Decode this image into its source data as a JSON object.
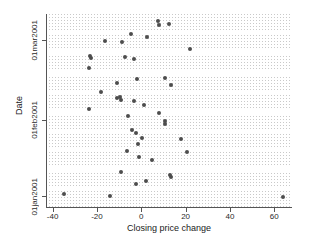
{
  "chart_data": {
    "type": "scatter",
    "title": "",
    "xlabel": "Closing price change",
    "ylabel": "Date",
    "xlim": [
      -43,
      68
    ],
    "ylim_labels": [
      "01jan2001",
      "01mar2001"
    ],
    "grid": "dotted-bands",
    "legend": "none",
    "marker_color": "#4d4d4d",
    "axis_color": "#555555",
    "x_ticks": [
      {
        "value": -40,
        "label": "-40"
      },
      {
        "value": -20,
        "label": "-20"
      },
      {
        "value": 0,
        "label": "0"
      },
      {
        "value": 20,
        "label": "20"
      },
      {
        "value": 40,
        "label": "40"
      },
      {
        "value": 60,
        "label": "60"
      }
    ],
    "y_ticks": [
      {
        "label": "01jan2001",
        "py": 196
      },
      {
        "label": "01feb2001",
        "py": 120
      },
      {
        "label": "01mar2001",
        "py": 40
      }
    ],
    "points": [
      {
        "x": 7.5,
        "py": 21
      },
      {
        "x": 8.0,
        "py": 25
      },
      {
        "x": 12.5,
        "py": 24
      },
      {
        "x": -4.5,
        "py": 34
      },
      {
        "x": 2.5,
        "py": 37
      },
      {
        "x": -16.5,
        "py": 41
      },
      {
        "x": -8.5,
        "py": 42
      },
      {
        "x": 22.0,
        "py": 49
      },
      {
        "x": -7.5,
        "py": 57
      },
      {
        "x": -3.5,
        "py": 59
      },
      {
        "x": -23.0,
        "py": 56
      },
      {
        "x": -22.5,
        "py": 58
      },
      {
        "x": -23.5,
        "py": 68
      },
      {
        "x": -2.0,
        "py": 79
      },
      {
        "x": 10.5,
        "py": 78
      },
      {
        "x": -11.0,
        "py": 83
      },
      {
        "x": 13.5,
        "py": 85
      },
      {
        "x": -18.0,
        "py": 92
      },
      {
        "x": -11.0,
        "py": 98
      },
      {
        "x": -9.5,
        "py": 97
      },
      {
        "x": -9.0,
        "py": 100
      },
      {
        "x": -3.5,
        "py": 101
      },
      {
        "x": -23.5,
        "py": 109
      },
      {
        "x": 1.0,
        "py": 105
      },
      {
        "x": 8.0,
        "py": 113
      },
      {
        "x": -6.0,
        "py": 116
      },
      {
        "x": 10.5,
        "py": 121
      },
      {
        "x": 10.5,
        "py": 124
      },
      {
        "x": -4.0,
        "py": 130
      },
      {
        "x": -2.5,
        "py": 133
      },
      {
        "x": 0.5,
        "py": 138
      },
      {
        "x": 18.0,
        "py": 139
      },
      {
        "x": -1.5,
        "py": 144
      },
      {
        "x": -6.5,
        "py": 151
      },
      {
        "x": 20.5,
        "py": 152
      },
      {
        "x": -1.0,
        "py": 157
      },
      {
        "x": 5.0,
        "py": 160
      },
      {
        "x": -9.0,
        "py": 172
      },
      {
        "x": 13.0,
        "py": 175
      },
      {
        "x": 13.5,
        "py": 177
      },
      {
        "x": -2.5,
        "py": 184
      },
      {
        "x": 2.0,
        "py": 181
      },
      {
        "x": -35.0,
        "py": 194
      },
      {
        "x": -14.0,
        "py": 196
      },
      {
        "x": 64.0,
        "py": 197
      }
    ],
    "band_gaps_py": [
      8,
      30,
      50,
      71,
      90,
      110,
      129,
      148,
      167,
      187
    ]
  }
}
